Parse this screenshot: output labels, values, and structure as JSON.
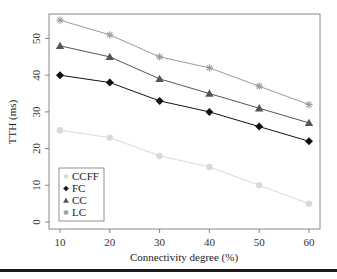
{
  "chart_data": {
    "type": "line",
    "title": "",
    "xlabel": "Connectivity degree (%)",
    "ylabel": "TTH (ms)",
    "x": [
      10,
      20,
      30,
      40,
      50,
      60
    ],
    "x_ticks": [
      "10",
      "20",
      "30",
      "40",
      "50",
      "60"
    ],
    "y_ticks": [
      "0",
      "10",
      "20",
      "30",
      "40",
      "50"
    ],
    "xlim": [
      8,
      62
    ],
    "ylim": [
      -2,
      57
    ],
    "grid": false,
    "legend_position": "lower-left",
    "series": [
      {
        "name": "CCFF",
        "marker": "circle",
        "color": "#d9d9d9",
        "values": [
          25,
          23,
          18,
          15,
          10,
          5
        ]
      },
      {
        "name": "FC",
        "marker": "diamond",
        "color": "#111111",
        "values": [
          40,
          38,
          33,
          30,
          26,
          22
        ]
      },
      {
        "name": "CC",
        "marker": "triangle",
        "color": "#555555",
        "values": [
          48,
          45,
          39,
          35,
          31,
          27
        ]
      },
      {
        "name": "LC",
        "marker": "star",
        "color": "#9a9a9a",
        "values": [
          55,
          51,
          45,
          42,
          37,
          32
        ]
      }
    ]
  }
}
